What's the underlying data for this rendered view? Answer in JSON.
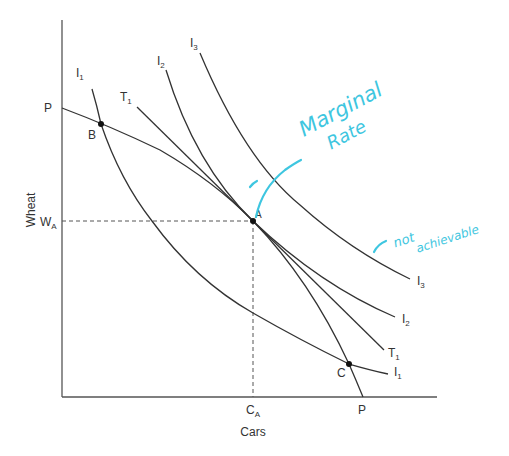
{
  "diagram": {
    "axes": {
      "y_label": "Wheat",
      "x_label": "Cars"
    },
    "ppf": {
      "name": "P",
      "intercept_y_label": "P",
      "intercept_x_label": "P"
    },
    "curves": {
      "i1": {
        "main": "I",
        "sub": "1"
      },
      "i2": {
        "main": "I",
        "sub": "2"
      },
      "i3": {
        "main": "I",
        "sub": "3"
      },
      "t1": {
        "main": "T",
        "sub": "1"
      }
    },
    "points": {
      "a": "A",
      "b": "B",
      "c": "C"
    },
    "reference": {
      "wa": {
        "main": "W",
        "sub": "A"
      },
      "ca": {
        "main": "C",
        "sub": "A"
      }
    },
    "annotations": {
      "marginal_rate_line1": "Marginal",
      "marginal_rate_line2": "Rate",
      "not_achievable_line1": "not",
      "not_achievable_line2": "achievable"
    },
    "colors": {
      "ink": "#3ec6e0",
      "lines": "#333333"
    }
  }
}
